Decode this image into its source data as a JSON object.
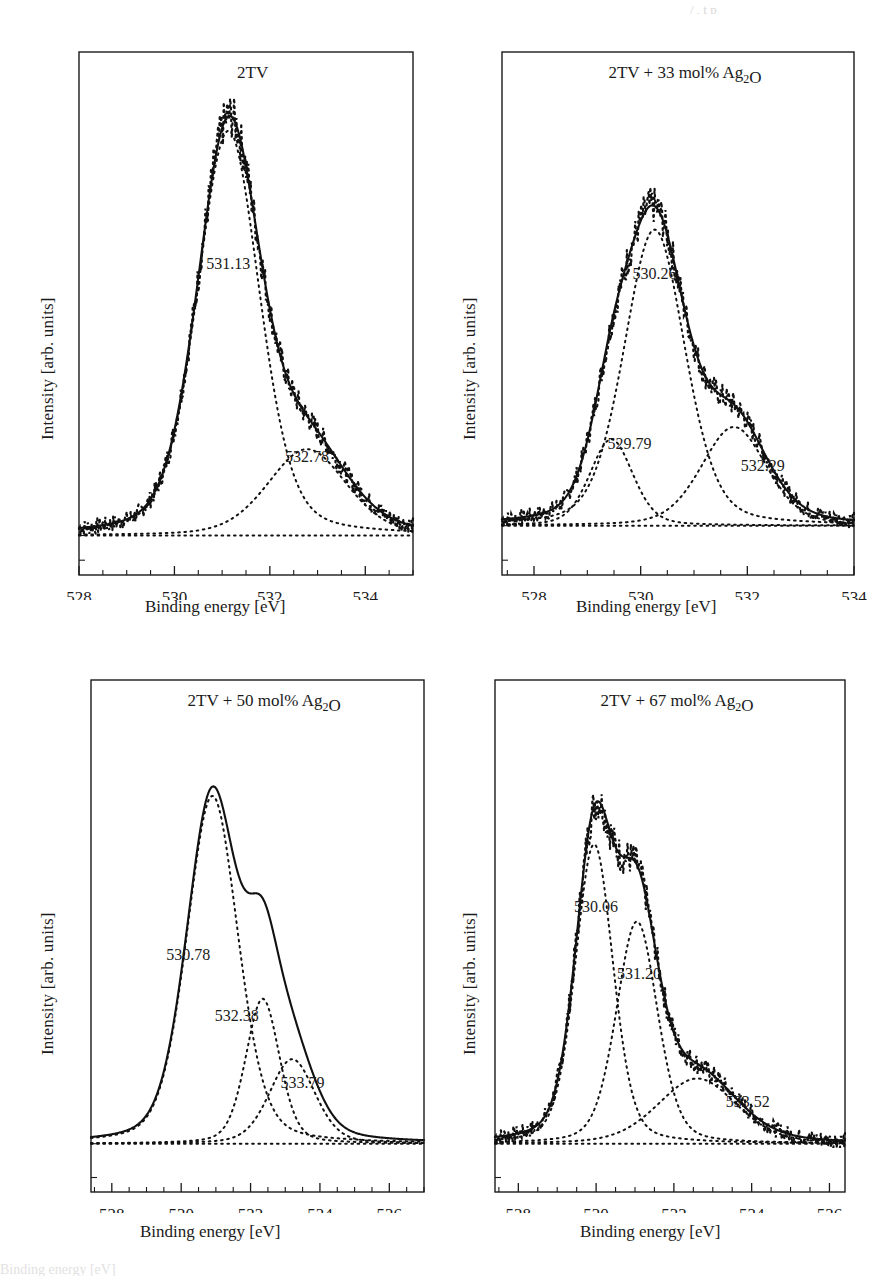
{
  "figure": {
    "axis_labels": {
      "x": "Binding energy [eV]",
      "y": "Intensity [arb. units]"
    },
    "top_cropped_text": "/ , t p",
    "bottom_cropped_text": "Binding energy [eV]"
  },
  "chart_data": [
    {
      "id": "panel-1",
      "type": "line",
      "title": "2TV",
      "xlabel": "Binding energy [eV]",
      "ylabel": "Intensity [arb. units]",
      "xlim": [
        528,
        535
      ],
      "ticks": [
        528,
        530,
        532,
        534
      ],
      "minor_tick_step": 0.5,
      "grid": false,
      "legend": "none",
      "baseline": 0.08,
      "annotations": [
        {
          "label": "531.13",
          "x": 531.13,
          "y": 0.62
        },
        {
          "label": "532.78",
          "x": 532.78,
          "y": 0.23
        }
      ],
      "components": [
        {
          "name": "O1s-a",
          "center": 531.13,
          "amplitude": 0.82,
          "fwhm": 1.55
        },
        {
          "name": "O1s-b",
          "center": 532.78,
          "amplitude": 0.175,
          "fwhm": 1.95
        }
      ],
      "series": [
        {
          "name": "envelope",
          "style": "solid"
        },
        {
          "name": "fit-components",
          "style": "dotted"
        },
        {
          "name": "raw-data",
          "style": "dotted"
        }
      ]
    },
    {
      "id": "panel-2",
      "type": "line",
      "title": "2TV + 33 mol% Ag2O",
      "title_html": "2TV + 33 mol% Ag<sub>2</sub>O",
      "xlabel": "Binding energy [eV]",
      "ylabel": "Intensity [arb. units]",
      "xlim": [
        527.4,
        534
      ],
      "ticks": [
        528,
        530,
        532,
        534
      ],
      "minor_tick_step": 0.5,
      "grid": false,
      "legend": "none",
      "baseline": 0.1,
      "annotations": [
        {
          "label": "530.26",
          "x": 530.26,
          "y": 0.6
        },
        {
          "label": "529.79",
          "x": 529.79,
          "y": 0.255
        },
        {
          "label": "532.29",
          "x": 532.29,
          "y": 0.21
        }
      ],
      "components": [
        {
          "name": "O1s-a",
          "center": 530.26,
          "amplitude": 0.6,
          "fwhm": 1.35
        },
        {
          "name": "O1s-b",
          "center": 529.45,
          "amplitude": 0.175,
          "fwhm": 0.95
        },
        {
          "name": "O1s-c",
          "center": 531.75,
          "amplitude": 0.2,
          "fwhm": 1.45
        }
      ],
      "series": [
        {
          "name": "envelope",
          "style": "solid"
        },
        {
          "name": "fit-components",
          "style": "dotted"
        },
        {
          "name": "raw-data",
          "style": "dotted"
        }
      ]
    },
    {
      "id": "panel-3",
      "type": "line",
      "title": "2TV + 50 mol% Ag2O",
      "title_html": "2TV + 50 mol% Ag<sub>2</sub>O",
      "xlabel": "Binding energy [eV]",
      "ylabel": "Intensity [arb. units]",
      "xlim": [
        527.4,
        537
      ],
      "ticks": [
        528,
        530,
        532,
        534,
        536
      ],
      "minor_tick_step": 0.5,
      "grid": false,
      "legend": "none",
      "baseline": 0.1,
      "annotations": [
        {
          "label": "530.78",
          "x": 530.2,
          "y": 0.48
        },
        {
          "label": "532.38",
          "x": 531.6,
          "y": 0.355
        },
        {
          "label": "533.79",
          "x": 533.5,
          "y": 0.215
        }
      ],
      "components": [
        {
          "name": "O1s-a",
          "center": 530.9,
          "amplitude": 0.72,
          "fwhm": 1.75
        },
        {
          "name": "O1s-b",
          "center": 532.35,
          "amplitude": 0.3,
          "fwhm": 1.15
        },
        {
          "name": "O1s-c",
          "center": 533.2,
          "amplitude": 0.175,
          "fwhm": 1.55
        }
      ],
      "series": [
        {
          "name": "envelope",
          "style": "solid"
        },
        {
          "name": "fit-components",
          "style": "dotted"
        }
      ]
    },
    {
      "id": "panel-4",
      "type": "line",
      "title": "2TV + 67 mol% Ag2O",
      "title_html": "2TV + 67 mol% Ag<sub>2</sub>O",
      "xlabel": "Binding energy [eV]",
      "ylabel": "Intensity [arb. units]",
      "xlim": [
        527.4,
        536.4
      ],
      "ticks": [
        528,
        530,
        532,
        534,
        536
      ],
      "minor_tick_step": 0.5,
      "grid": false,
      "legend": "none",
      "baseline": 0.1,
      "annotations": [
        {
          "label": "530.06",
          "x": 530.0,
          "y": 0.58
        },
        {
          "label": "531.20",
          "x": 531.1,
          "y": 0.44
        },
        {
          "label": "533.52",
          "x": 533.9,
          "y": 0.175
        }
      ],
      "components": [
        {
          "name": "O1s-a",
          "center": 529.95,
          "amplitude": 0.62,
          "fwhm": 1.15
        },
        {
          "name": "O1s-b",
          "center": 531.05,
          "amplitude": 0.46,
          "fwhm": 1.25
        },
        {
          "name": "O1s-c",
          "center": 532.6,
          "amplitude": 0.135,
          "fwhm": 2.4
        }
      ],
      "series": [
        {
          "name": "envelope",
          "style": "solid"
        },
        {
          "name": "fit-components",
          "style": "dotted"
        },
        {
          "name": "raw-data",
          "style": "dotted"
        }
      ]
    }
  ]
}
